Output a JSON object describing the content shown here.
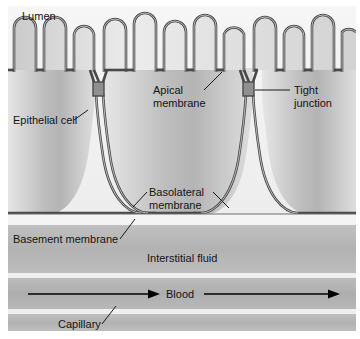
{
  "figure": {
    "kind": "epithelial-transport-diagram",
    "background_color": "#ffffff",
    "ink_color": "#141414",
    "membrane_color": "#4a4a4a"
  },
  "labels": {
    "lumen": "Lumen",
    "epithelial_cell": "Epithelial cell",
    "apical_membrane_line1": "Apical",
    "apical_membrane_line2": "membrane",
    "tight_junction_line1": "Tight",
    "tight_junction_line2": "junction",
    "basolateral_membrane_line1": "Basolateral",
    "basolateral_membrane_line2": "membrane",
    "basement_membrane": "Basement membrane",
    "interstitial_fluid": "Interstitial fluid",
    "blood": "Blood",
    "capillary": "Capillary"
  },
  "regions": {
    "lumen_fill": "#f1f1f1",
    "cell_fill_light": "#e4e4e4",
    "cell_fill_dark": "#b9b9b9",
    "interstitial_fill": "#b4b4b4",
    "capillary_fill": "#b0b0b0",
    "capillary_wall_fill": "#b4b4b4",
    "basement_gap_fill": "#f4f4f4"
  },
  "structure": {
    "microvilli_count": 13,
    "tight_junction_count": 2,
    "epithelial_cell_count": 3,
    "blood_flow_arrow_count": 2,
    "blood_flow_direction": "left-to-right"
  }
}
